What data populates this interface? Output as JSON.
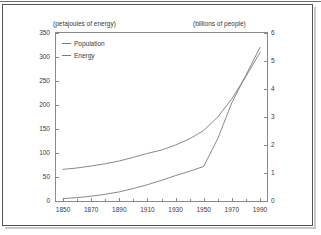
{
  "chart_data": {
    "type": "line",
    "title": "",
    "xlabel": "",
    "ylabel": "(petajoules of energy)",
    "y2label": "(billions of people)",
    "x": [
      1850,
      1860,
      1870,
      1880,
      1890,
      1900,
      1910,
      1920,
      1930,
      1940,
      1950,
      1960,
      1970,
      1980,
      1990
    ],
    "xlim": [
      1845,
      1995
    ],
    "xticks": [
      1850,
      1870,
      1890,
      1910,
      1930,
      1950,
      1970,
      1990
    ],
    "xtick_labels": [
      "1850",
      "1870",
      "1890",
      "1910",
      "1930",
      "1950",
      "1970",
      "1990"
    ],
    "xminor_ticks": [
      1860,
      1880,
      1900,
      1920,
      1940,
      1960,
      1980
    ],
    "ylim": [
      0,
      350
    ],
    "yticks": [
      0,
      50,
      100,
      150,
      200,
      250,
      300,
      350
    ],
    "ytick_labels": [
      "0",
      "50",
      "100",
      "150",
      "200",
      "250",
      "300",
      "350"
    ],
    "y2lim": [
      0,
      6
    ],
    "y2ticks": [
      0,
      1,
      2,
      3,
      4,
      5,
      6
    ],
    "y2tick_labels": [
      "0",
      "1",
      "2",
      "3",
      "4",
      "5",
      "6"
    ],
    "grid": false,
    "legend_position": "top-left",
    "series": [
      {
        "name": "Population",
        "axis": "right",
        "unit": "billions of people",
        "color": "#7a7a7a",
        "values": [
          1.13,
          1.18,
          1.25,
          1.33,
          1.43,
          1.56,
          1.7,
          1.82,
          2.0,
          2.22,
          2.52,
          3.0,
          3.65,
          4.45,
          5.3
        ]
      },
      {
        "name": "Energy",
        "axis": "left",
        "unit": "petajoules of energy",
        "color": "#7a7a7a",
        "values": [
          5,
          7,
          10,
          14,
          19,
          26,
          34,
          43,
          53,
          62,
          72,
          130,
          205,
          262,
          320
        ]
      }
    ],
    "annotations": []
  },
  "legend": {
    "items": [
      {
        "label": "Population"
      },
      {
        "label": "Energy"
      }
    ]
  },
  "captions": {
    "left": "(petajoules of energy)",
    "right": "(billions of people)"
  }
}
